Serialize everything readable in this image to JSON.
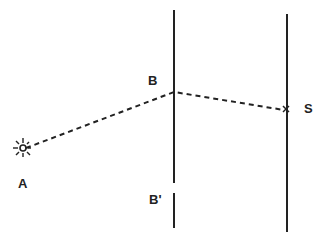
{
  "diagram": {
    "type": "optics-path",
    "labels": {
      "source": "A",
      "slit_top": "B",
      "slit_bottom": "B'",
      "screen_point": "S"
    },
    "colors": {
      "ink": "#222222",
      "background": "#ffffff"
    },
    "elements": [
      {
        "id": "source",
        "label": "A",
        "shape": "star-burst"
      },
      {
        "id": "barrier",
        "label": "B / B'",
        "shape": "vertical-line-with-gap"
      },
      {
        "id": "screen",
        "label": "S",
        "shape": "vertical-line"
      },
      {
        "id": "ray",
        "from": "A",
        "via": "B",
        "to": "S",
        "style": "dashed"
      }
    ]
  }
}
